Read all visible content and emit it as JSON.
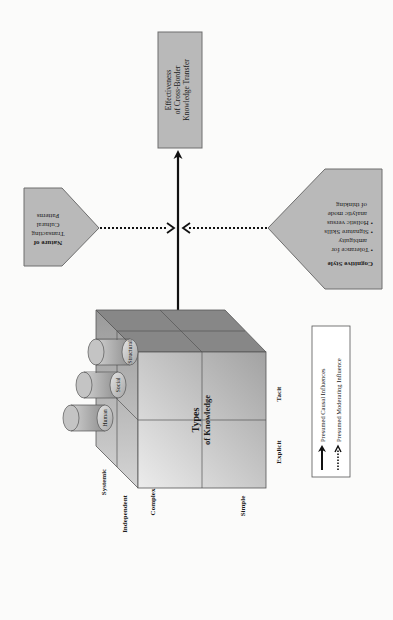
{
  "diagram": {
    "outcome_box": {
      "lines": [
        "Effectiveness",
        "of Cross-Border",
        "Knowledge Transfer"
      ]
    },
    "left_moderator": {
      "lines": [
        "Nature of",
        "Transacting",
        "Cultural",
        "Patterns"
      ]
    },
    "right_moderator": {
      "title": "Cognitive Style",
      "bullets": [
        [
          "• Tolerance for",
          "ambiguity"
        ],
        [
          "• Signature Skills"
        ],
        [
          "• Holistic versus",
          "analytic mode",
          "of thinking"
        ]
      ]
    },
    "cube": {
      "center_label": [
        "Types",
        "of Knowledge"
      ],
      "cylinders": [
        "Human",
        "Social",
        "Structural"
      ],
      "axis_labels": {
        "front_left": "Explicit",
        "front_right": "Tacit",
        "depth_back": "Systemic",
        "depth_front": "Independent",
        "bottom_back": "Complex",
        "bottom_front": "Simple"
      }
    },
    "legend": {
      "items": [
        {
          "label": "Presumed Causal Influences",
          "style": "solid"
        },
        {
          "label": "Presumed Moderating Influence",
          "style": "dotted"
        }
      ]
    },
    "colors": {
      "box_fill": "#b9b9b9",
      "box_stroke": "#6e6e6e",
      "cube_top": "#8a8a8a",
      "cube_front_light": "#dcdcdc",
      "cube_front_dark": "#a9a9a9",
      "line": "#111111"
    }
  }
}
